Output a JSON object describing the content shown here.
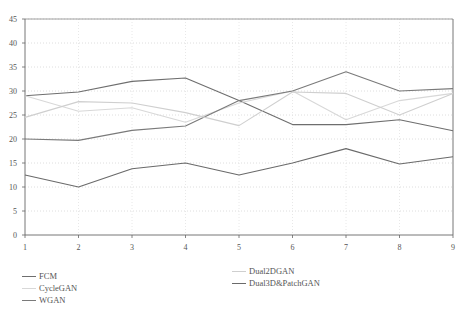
{
  "chart_data": {
    "type": "line",
    "title": "",
    "xlabel": "",
    "ylabel": "",
    "x": [
      1,
      2,
      3,
      4,
      5,
      6,
      7,
      8,
      9
    ],
    "ylim": [
      0,
      45
    ],
    "yticks": [
      0,
      5,
      10,
      15,
      20,
      25,
      30,
      35,
      40,
      45
    ],
    "grid": true,
    "legend_position": "bottom",
    "series": [
      {
        "name": "FCM",
        "color": "#6e6e6e",
        "values": [
          29.0,
          29.8,
          32.0,
          32.7,
          28.0,
          23.0,
          23.0,
          24.0,
          21.7
        ]
      },
      {
        "name": "CycleGAN",
        "color": "#d8d8d8",
        "values": [
          29.0,
          25.8,
          26.5,
          23.5,
          27.5,
          30.0,
          24.0,
          28.0,
          29.5
        ]
      },
      {
        "name": "WGAN",
        "color": "#7a7a7a",
        "values": [
          20.0,
          19.7,
          21.8,
          22.7,
          28.0,
          30.0,
          34.0,
          30.0,
          30.5
        ]
      },
      {
        "name": "Dual2DGAN",
        "color": "#cfcfcf",
        "values": [
          24.5,
          27.8,
          27.5,
          25.5,
          22.8,
          29.8,
          29.5,
          25.0,
          29.5
        ]
      },
      {
        "name": "Dual3D&PatchGAN",
        "color": "#6a6a6a",
        "values": [
          12.5,
          10.0,
          13.8,
          15.0,
          12.5,
          15.0,
          18.0,
          14.8,
          16.3
        ]
      }
    ]
  },
  "legend": {
    "left": [
      "FCM",
      "CycleGAN",
      "WGAN"
    ],
    "right": [
      "Dual2DGAN",
      "Dual3D&PatchGAN"
    ]
  }
}
